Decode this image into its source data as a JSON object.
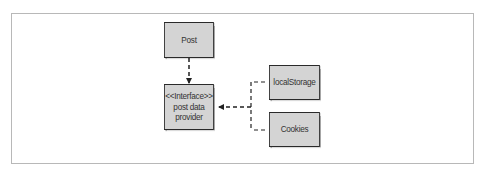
{
  "diagram": {
    "type": "uml-dependency",
    "nodes": {
      "post": {
        "label": "Post"
      },
      "interface": {
        "stereotype": "<<Interface>>",
        "line1": "post data",
        "line2": "provider"
      },
      "local_storage": {
        "label": "localStorage"
      },
      "cookies": {
        "label": "Cookies"
      }
    },
    "edges": [
      {
        "from": "Post",
        "to": "<<Interface>> post data provider",
        "style": "dashed",
        "arrow": "filled"
      },
      {
        "from": "localStorage",
        "to": "<<Interface>> post data provider",
        "style": "dashed",
        "arrow": "filled"
      },
      {
        "from": "Cookies",
        "to": "<<Interface>> post data provider",
        "style": "dashed",
        "arrow": "filled"
      }
    ],
    "colors": {
      "node_fill": "#d4d4d4",
      "node_border": "#2a2a2a",
      "edge": "#222222",
      "frame_border": "#b8b8b8"
    }
  }
}
